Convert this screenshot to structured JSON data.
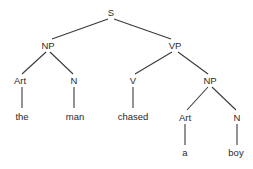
{
  "diagram": {
    "type": "syntax-tree",
    "nodes": [
      {
        "id": "s",
        "label": "S",
        "x": 111,
        "y": 16
      },
      {
        "id": "np1",
        "label": "NP",
        "x": 48,
        "y": 49
      },
      {
        "id": "vp",
        "label": "VP",
        "x": 175,
        "y": 49
      },
      {
        "id": "art1",
        "label": "Art",
        "x": 20,
        "y": 84
      },
      {
        "id": "n1",
        "label": "N",
        "x": 74,
        "y": 84
      },
      {
        "id": "v",
        "label": "V",
        "x": 133,
        "y": 84
      },
      {
        "id": "np2",
        "label": "NP",
        "x": 210,
        "y": 84
      },
      {
        "id": "the",
        "label": "the",
        "x": 22,
        "y": 120
      },
      {
        "id": "man",
        "label": "man",
        "x": 75,
        "y": 120
      },
      {
        "id": "chased",
        "label": "chased",
        "x": 133,
        "y": 120
      },
      {
        "id": "art2",
        "label": "Art",
        "x": 185,
        "y": 121
      },
      {
        "id": "n2",
        "label": "N",
        "x": 237,
        "y": 121
      },
      {
        "id": "a",
        "label": "a",
        "x": 185,
        "y": 156
      },
      {
        "id": "boy",
        "label": "boy",
        "x": 236,
        "y": 156
      }
    ],
    "edges": [
      {
        "from": "s",
        "to": "np1",
        "x1": 108,
        "y1": 19,
        "x2": 52,
        "y2": 39
      },
      {
        "from": "s",
        "to": "vp",
        "x1": 114,
        "y1": 19,
        "x2": 171,
        "y2": 39
      },
      {
        "from": "np1",
        "to": "art1",
        "x1": 46,
        "y1": 52,
        "x2": 22,
        "y2": 74
      },
      {
        "from": "np1",
        "to": "n1",
        "x1": 50,
        "y1": 52,
        "x2": 73,
        "y2": 74
      },
      {
        "from": "vp",
        "to": "v",
        "x1": 172,
        "y1": 52,
        "x2": 135,
        "y2": 74
      },
      {
        "from": "vp",
        "to": "np2",
        "x1": 178,
        "y1": 52,
        "x2": 208,
        "y2": 74
      },
      {
        "from": "art1",
        "to": "the",
        "x1": 22,
        "y1": 87,
        "x2": 22,
        "y2": 108
      },
      {
        "from": "n1",
        "to": "man",
        "x1": 74,
        "y1": 87,
        "x2": 74,
        "y2": 108
      },
      {
        "from": "v",
        "to": "chased",
        "x1": 133,
        "y1": 87,
        "x2": 133,
        "y2": 108
      },
      {
        "from": "np2",
        "to": "art2",
        "x1": 208,
        "y1": 87,
        "x2": 187,
        "y2": 110
      },
      {
        "from": "np2",
        "to": "n2",
        "x1": 212,
        "y1": 87,
        "x2": 236,
        "y2": 110
      },
      {
        "from": "art2",
        "to": "a",
        "x1": 185,
        "y1": 124,
        "x2": 185,
        "y2": 145
      },
      {
        "from": "n2",
        "to": "boy",
        "x1": 237,
        "y1": 124,
        "x2": 237,
        "y2": 145
      }
    ],
    "colors": {
      "line": "#3a3a3a",
      "text": "#2a2a2a",
      "background": "#ffffff"
    }
  }
}
